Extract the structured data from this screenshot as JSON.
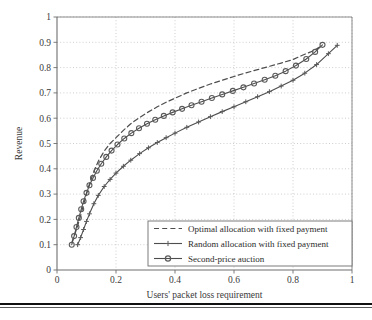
{
  "figure": {
    "background_color": "#ffffff",
    "plot_area": {
      "left": 57,
      "top": 17,
      "right": 352,
      "bottom": 270
    },
    "grid": "dotted",
    "grid_color": "#b9b9b9",
    "axis_color": "#6e6e6e",
    "line_color": "#4d4d4d",
    "marker_color": "#5a5a5a"
  },
  "chart_data": {
    "type": "line",
    "title": "",
    "xlabel": "Users' packet loss requirement",
    "ylabel": "Revenue",
    "xlim": [
      0,
      1
    ],
    "ylim": [
      0,
      1
    ],
    "xticks": [
      0,
      0.2,
      0.4,
      0.6,
      0.8,
      1
    ],
    "xtick_labels": [
      "0",
      "0.2",
      "0.4",
      "0.6",
      "0.8",
      "1"
    ],
    "yticks": [
      0,
      0.1,
      0.2,
      0.3,
      0.4,
      0.5,
      0.6,
      0.7,
      0.8,
      0.9,
      1
    ],
    "ytick_labels": [
      "0",
      "0.1",
      "0.2",
      "0.3",
      "0.4",
      "0.5",
      "0.6",
      "0.7",
      "0.8",
      "0.9",
      "1"
    ],
    "grid": true,
    "legend_position": "lower right",
    "series": [
      {
        "name": "Optimal allocation with fixed payment",
        "style": "dashed",
        "marker": "none",
        "x": [
          0.05,
          0.06,
          0.07,
          0.08,
          0.09,
          0.1,
          0.11,
          0.125,
          0.14,
          0.16,
          0.18,
          0.2,
          0.225,
          0.25,
          0.28,
          0.31,
          0.34,
          0.37,
          0.4,
          0.44,
          0.48,
          0.52,
          0.56,
          0.6,
          0.64,
          0.68,
          0.72,
          0.76,
          0.8,
          0.83,
          0.86,
          0.88,
          0.9
        ],
        "y": [
          0.108,
          0.14,
          0.175,
          0.215,
          0.258,
          0.3,
          0.34,
          0.39,
          0.43,
          0.47,
          0.5,
          0.523,
          0.552,
          0.578,
          0.603,
          0.625,
          0.645,
          0.663,
          0.679,
          0.7,
          0.718,
          0.735,
          0.75,
          0.765,
          0.779,
          0.792,
          0.805,
          0.818,
          0.832,
          0.848,
          0.862,
          0.874,
          0.888
        ]
      },
      {
        "name": "Random allocation with fixed payment",
        "style": "solid",
        "marker": "plus",
        "x": [
          0.07,
          0.08,
          0.09,
          0.1,
          0.11,
          0.125,
          0.14,
          0.16,
          0.18,
          0.2,
          0.225,
          0.25,
          0.28,
          0.31,
          0.34,
          0.37,
          0.4,
          0.44,
          0.48,
          0.52,
          0.56,
          0.6,
          0.64,
          0.68,
          0.72,
          0.76,
          0.8,
          0.84,
          0.88,
          0.92,
          0.95
        ],
        "y": [
          0.1,
          0.128,
          0.16,
          0.192,
          0.222,
          0.262,
          0.295,
          0.33,
          0.358,
          0.383,
          0.41,
          0.434,
          0.46,
          0.483,
          0.504,
          0.523,
          0.541,
          0.564,
          0.585,
          0.606,
          0.626,
          0.645,
          0.665,
          0.685,
          0.705,
          0.727,
          0.75,
          0.778,
          0.812,
          0.855,
          0.888
        ]
      },
      {
        "name": "Second-price auction",
        "style": "solid",
        "marker": "circle",
        "x": [
          0.05,
          0.058,
          0.066,
          0.074,
          0.082,
          0.09,
          0.1,
          0.11,
          0.122,
          0.135,
          0.15,
          0.167,
          0.185,
          0.205,
          0.228,
          0.252,
          0.278,
          0.305,
          0.333,
          0.362,
          0.392,
          0.424,
          0.456,
          0.49,
          0.525,
          0.56,
          0.596,
          0.632,
          0.668,
          0.704,
          0.74,
          0.775,
          0.81,
          0.845,
          0.875,
          0.9
        ],
        "y": [
          0.1,
          0.134,
          0.17,
          0.206,
          0.24,
          0.272,
          0.305,
          0.335,
          0.364,
          0.392,
          0.42,
          0.447,
          0.472,
          0.496,
          0.52,
          0.541,
          0.56,
          0.578,
          0.594,
          0.609,
          0.623,
          0.637,
          0.651,
          0.665,
          0.68,
          0.694,
          0.708,
          0.722,
          0.737,
          0.752,
          0.768,
          0.786,
          0.808,
          0.834,
          0.862,
          0.89
        ]
      }
    ]
  },
  "legend": {
    "entries": [
      {
        "label": "Optimal allocation with fixed payment",
        "style": "dashed",
        "marker": "none"
      },
      {
        "label": "Random allocation with fixed payment",
        "style": "solid",
        "marker": "plus"
      },
      {
        "label": "Second-price auction",
        "style": "solid",
        "marker": "circle"
      }
    ],
    "box": {
      "left": 148,
      "top": 221,
      "right": 352,
      "bottom": 266
    }
  },
  "page_rules": {
    "thick_color": "#111111",
    "thin_color": "#5a5a5a"
  }
}
